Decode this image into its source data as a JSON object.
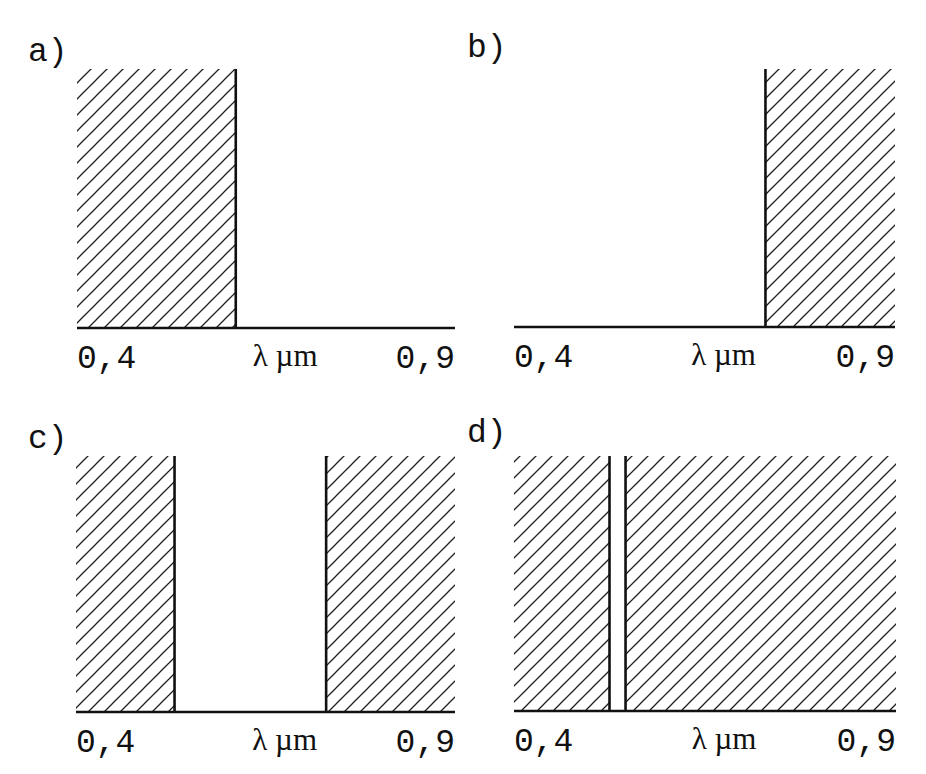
{
  "chart_data": [
    {
      "type": "area",
      "panel": "a",
      "title": "a)",
      "xlabel": "λ µm",
      "xlim": [
        0.4,
        0.9
      ],
      "tick_labels": {
        "min": "0,4",
        "max": "0,9"
      },
      "hatched_bands": [
        [
          0.4,
          0.61
        ]
      ],
      "edges": [
        0.61
      ]
    },
    {
      "type": "area",
      "panel": "b",
      "title": "b)",
      "xlabel": "λ µm",
      "xlim": [
        0.4,
        0.9
      ],
      "tick_labels": {
        "min": "0,4",
        "max": "0,9"
      },
      "hatched_bands": [
        [
          0.73,
          0.9
        ]
      ],
      "edges": [
        0.73
      ]
    },
    {
      "type": "area",
      "panel": "c",
      "title": "c)",
      "xlabel": "λ µm",
      "xlim": [
        0.4,
        0.9
      ],
      "tick_labels": {
        "min": "0,4",
        "max": "0,9"
      },
      "hatched_bands": [
        [
          0.4,
          0.53
        ],
        [
          0.73,
          0.9
        ]
      ],
      "edges": [
        0.53,
        0.73
      ]
    },
    {
      "type": "area",
      "panel": "d",
      "title": "d)",
      "xlabel": "λ µm",
      "xlim": [
        0.4,
        0.9
      ],
      "tick_labels": {
        "min": "0,4",
        "max": "0,9"
      },
      "hatched_bands": [
        [
          0.4,
          0.525
        ],
        [
          0.546,
          0.9
        ]
      ],
      "edges": [
        0.525,
        0.546
      ]
    }
  ]
}
